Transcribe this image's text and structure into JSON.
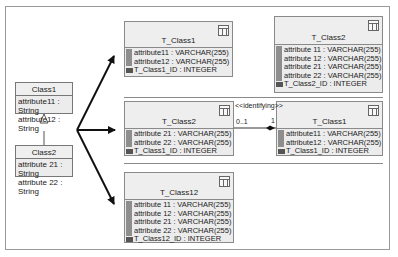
{
  "uml": {
    "class1": {
      "name": "Class1",
      "attributes": [
        "attribute11 : String",
        "attribute12 : String"
      ]
    },
    "class2": {
      "name": "Class2",
      "attributes": [
        "attribute 21 : String",
        "attribute 22 : String"
      ]
    }
  },
  "mappings": {
    "option1": {
      "t_class1": {
        "name": "T_Class1",
        "columns": [
          "attribute11 : VARCHAR(255)",
          "attribute12 : VARCHAR(255)"
        ],
        "pk": "T_Class1_ID : INTEGER"
      },
      "t_class2": {
        "name": "T_Class2",
        "columns": [
          "attribute 11 : VARCHAR(255)",
          "attribute 12 : VARCHAR(255)",
          "attribute 21 : VARCHAR(255)",
          "attribute 22 : VARCHAR(255)"
        ],
        "pk": "T_Class2_ID : INTEGER"
      }
    },
    "option2": {
      "t_class2": {
        "name": "T_Class2",
        "columns": [
          "attribute 21 : VARCHAR(255)",
          "attribute 22 : VARCHAR(255)"
        ],
        "pk": "T_Class1_ID : INTEGER"
      },
      "t_class1": {
        "name": "T_Class1",
        "columns": [
          "attribute11 : VARCHAR(255)",
          "attribute12 : VARCHAR(255)"
        ],
        "pk": "T_Class1_ID : INTEGER"
      },
      "relationship": {
        "stereotype": "<<identifying>>",
        "multiplicity_left": "0..1",
        "multiplicity_right": "1"
      }
    },
    "option3": {
      "t_class12": {
        "name": "T_Class12",
        "columns": [
          "attribute 11 : VARCHAR(255)",
          "attribute 12 : VARCHAR(255)",
          "attribute 21 : VARCHAR(255)",
          "attribute 22 : VARCHAR(255)"
        ],
        "pk": "T_Class12_ID : INTEGER"
      }
    }
  },
  "colors": {
    "border": "#9a9a9a",
    "box_fill": "#ececec",
    "key_bar": "#8e8e8e",
    "arrow": "#111111"
  }
}
